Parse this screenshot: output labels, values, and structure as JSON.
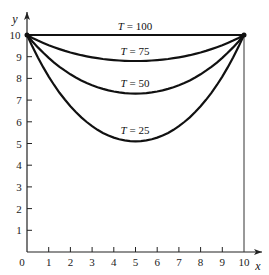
{
  "chart_data": {
    "type": "line",
    "title": "",
    "xlabel": "x",
    "ylabel": "y",
    "xlim": [
      0,
      10
    ],
    "ylim": [
      0,
      10
    ],
    "x_ticks": [
      "1",
      "2",
      "3",
      "4",
      "5",
      "6",
      "7",
      "8",
      "9",
      "10"
    ],
    "y_ticks": [
      "1",
      "2",
      "3",
      "4",
      "5",
      "6",
      "7",
      "8",
      "9",
      "10"
    ],
    "origin_label": "0",
    "grid": false,
    "legend": "none (curves labeled inline)",
    "series": [
      {
        "name": "T = 100",
        "label_italic": "T",
        "label_value": "= 100",
        "x": [
          0,
          5,
          10
        ],
        "y": [
          10,
          10,
          10
        ]
      },
      {
        "name": "T = 75",
        "label_italic": "T",
        "label_value": "= 75",
        "x": [
          0,
          2.5,
          5,
          7.5,
          10
        ],
        "y": [
          10,
          9.1,
          8.8,
          9.1,
          10
        ]
      },
      {
        "name": "T = 50",
        "label_italic": "T",
        "label_value": "= 50",
        "x": [
          0,
          2.5,
          5,
          7.5,
          10
        ],
        "y": [
          10,
          8.0,
          7.3,
          8.0,
          10
        ]
      },
      {
        "name": "T = 25",
        "label_italic": "T",
        "label_value": "= 25",
        "x": [
          0,
          2.5,
          5,
          7.5,
          10
        ],
        "y": [
          10,
          6.3,
          5.1,
          6.3,
          10
        ]
      }
    ],
    "annotations": [
      "vertical line at x = 10 from y = 0 to y = 10"
    ]
  }
}
